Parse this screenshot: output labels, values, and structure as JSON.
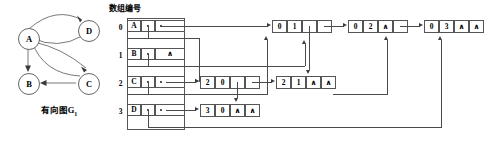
{
  "figure": {
    "header_label": "数组编号",
    "graph_caption": "有向图G",
    "graph_caption_sub": "1"
  },
  "graph": {
    "nodes": [
      {
        "id": "A",
        "label": "A",
        "x": 18,
        "y": 28
      },
      {
        "id": "D",
        "label": "D",
        "x": 78,
        "y": 20
      },
      {
        "id": "B",
        "label": "B",
        "x": 18,
        "y": 73
      },
      {
        "id": "C",
        "label": "C",
        "x": 78,
        "y": 73
      }
    ],
    "edges": [
      {
        "from": "A",
        "to": "D"
      },
      {
        "from": "D",
        "to": "A"
      },
      {
        "from": "A",
        "to": "B"
      },
      {
        "from": "A",
        "to": "C"
      },
      {
        "from": "C",
        "to": "A"
      },
      {
        "from": "C",
        "to": "B"
      }
    ]
  },
  "array": {
    "rows": [
      {
        "index": "0",
        "vertex": "A",
        "firstin": "",
        "firstout": ""
      },
      {
        "index": "1",
        "vertex": "B",
        "firstin": "",
        "firstout": "∧"
      },
      {
        "index": "2",
        "vertex": "C",
        "firstin": "",
        "firstout": ""
      },
      {
        "index": "3",
        "vertex": "D",
        "firstin": "",
        "firstout": ""
      }
    ]
  },
  "nodes": {
    "n01": {
      "tail": "0",
      "head": "1",
      "hlink": "",
      "tlink": ""
    },
    "n02": {
      "tail": "0",
      "head": "2",
      "hlink": "∧",
      "tlink": ""
    },
    "n03": {
      "tail": "0",
      "head": "3",
      "hlink": "∧",
      "tlink": "∧"
    },
    "n20": {
      "tail": "2",
      "head": "0",
      "hlink": "",
      "tlink": ""
    },
    "n21": {
      "tail": "2",
      "head": "1",
      "hlink": "∧",
      "tlink": "∧"
    },
    "n30": {
      "tail": "3",
      "head": "0",
      "hlink": "∧",
      "tlink": "∧"
    }
  },
  "colors": {
    "line": "#4a4a4a",
    "border": "#555555",
    "background": "#ffffff",
    "text": "#000000"
  }
}
